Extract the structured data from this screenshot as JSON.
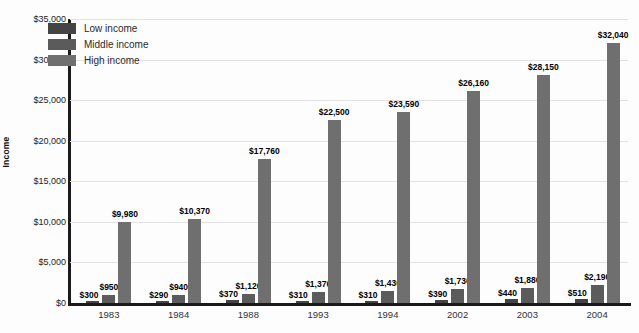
{
  "chart_data": {
    "type": "bar",
    "title": "",
    "xlabel": "",
    "ylabel": "Income",
    "ylim": [
      0,
      35000
    ],
    "grid": true,
    "legend_position": "inside-top-left",
    "categories": [
      "1983",
      "1984",
      "1988",
      "1993",
      "1994",
      "2002",
      "2003",
      "2004"
    ],
    "ytick_labels": [
      "$0",
      "$5,000",
      "$10,000",
      "$15,000",
      "$20,000",
      "$25,000",
      "$30,000",
      "$35,000"
    ],
    "ytick_values": [
      0,
      5000,
      10000,
      15000,
      20000,
      25000,
      30000,
      35000
    ],
    "series": [
      {
        "name": "Low income",
        "color": "#444444",
        "values": [
          300,
          290,
          370,
          310,
          310,
          390,
          440,
          510
        ],
        "labels": [
          "$300",
          "$290",
          "$370",
          "$310",
          "$310",
          "$390",
          "$440",
          "$510"
        ]
      },
      {
        "name": "Middle income",
        "color": "#5b5b5b",
        "values": [
          950,
          940,
          1120,
          1370,
          1430,
          1730,
          1880,
          2190
        ],
        "labels": [
          "$950",
          "$940",
          "$1,120",
          "$1,370",
          "$1,430",
          "$1,730",
          "$1,880",
          "$2,190"
        ]
      },
      {
        "name": "High income",
        "color": "#6f6f6f",
        "values": [
          9980,
          10370,
          17760,
          22500,
          23590,
          26160,
          28150,
          32040
        ],
        "labels": [
          "$9,980",
          "$10,370",
          "$17,760",
          "$22,500",
          "$23,590",
          "$26,160",
          "$28,150",
          "$32,040"
        ]
      }
    ]
  },
  "legend": {
    "items": [
      {
        "label": "Low income",
        "swatch": "sw-low"
      },
      {
        "label": "Middle income",
        "swatch": "sw-mid"
      },
      {
        "label": "High income",
        "swatch": "sw-high"
      }
    ]
  }
}
